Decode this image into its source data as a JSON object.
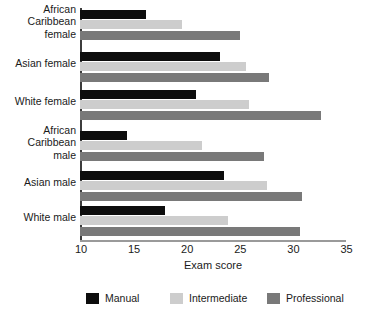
{
  "chart_data": {
    "type": "bar",
    "orientation": "horizontal",
    "title": "",
    "xlabel": "Exam score",
    "ylabel": "",
    "xlim": [
      10,
      35
    ],
    "xticks": [
      10,
      15,
      20,
      25,
      30,
      35
    ],
    "grid": false,
    "legend_position": "bottom",
    "categories": [
      "African\nCaribbean\nfemale",
      "Asian female",
      "White female",
      "African\nCaribbean\nmale",
      "Asian male",
      "White male"
    ],
    "series": [
      {
        "name": "Manual",
        "color": "#0d0d0d",
        "values": [
          16.2,
          23.2,
          20.9,
          14.4,
          23.6,
          18.0
        ]
      },
      {
        "name": "Intermediate",
        "color": "#cdcdcd",
        "values": [
          19.6,
          25.6,
          25.9,
          21.5,
          27.6,
          23.9
        ]
      },
      {
        "name": "Professional",
        "color": "#797979",
        "values": [
          25.1,
          27.8,
          32.7,
          27.3,
          30.9,
          30.7
        ]
      }
    ]
  },
  "axis": {
    "x_title": "Exam score",
    "tick_labels": [
      "10",
      "15",
      "20",
      "25",
      "30",
      "35"
    ]
  },
  "legend": {
    "items": [
      {
        "label": "Manual",
        "color": "#0d0d0d"
      },
      {
        "label": "Intermediate",
        "color": "#cdcdcd"
      },
      {
        "label": "Professional",
        "color": "#797979"
      }
    ]
  }
}
